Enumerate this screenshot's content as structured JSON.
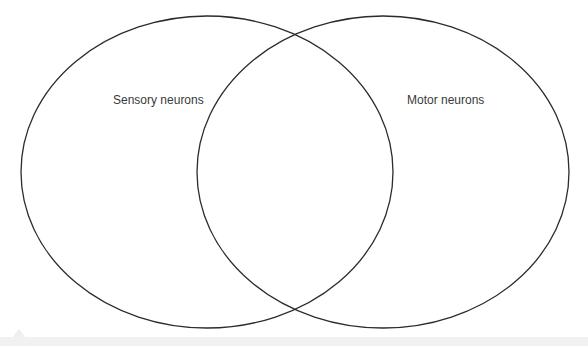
{
  "diagram": {
    "type": "venn",
    "sets": [
      {
        "label": "Sensory neurons",
        "cx": 207,
        "cy": 172,
        "rx": 186,
        "ry": 156
      },
      {
        "label": "Motor neurons",
        "cx": 383,
        "cy": 172,
        "rx": 186,
        "ry": 156
      }
    ],
    "stroke_color": "#2b2b2b",
    "background": "#ffffff"
  }
}
